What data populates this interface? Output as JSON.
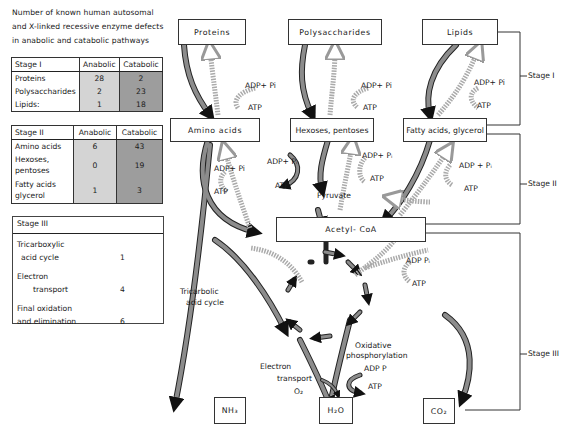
{
  "intro": {
    "lines": [
      "Number of known human autosomal",
      "and X-linked recessive enzyme defects",
      "in anabolic and catabolic pathways"
    ]
  },
  "table_stage1": {
    "title": "Stage I",
    "col_anabolic": "Anabolic",
    "col_catabolic": "Catabolic",
    "rows": [
      {
        "label": "Proteins",
        "anabolic": "28",
        "catabolic": "2"
      },
      {
        "label": "Polysaccharides",
        "anabolic": "2",
        "catabolic": "23"
      },
      {
        "label": "Lipids:",
        "anabolic": "1",
        "catabolic": "18"
      }
    ]
  },
  "table_stage2": {
    "title": "Stage II",
    "col_anabolic": "Anabolic",
    "col_catabolic": "Catabolic",
    "rows": [
      {
        "label": "Amino acids",
        "anabolic": "6",
        "catabolic": "43"
      },
      {
        "label": "Hexoses, pentoses",
        "anabolic": "0",
        "catabolic": "19"
      },
      {
        "label": "Fatty acids glycerol",
        "anabolic": "1",
        "catabolic": "3"
      }
    ]
  },
  "table_stage3": {
    "title": "Stage III",
    "rows": [
      {
        "label1": "Tricarboxylic",
        "label2": "acid cycle",
        "value": "1"
      },
      {
        "label1": "Electron",
        "label2": "transport",
        "value": "4"
      },
      {
        "label1": "Final oxidation",
        "label2": "and elimination",
        "value": "6"
      }
    ]
  },
  "diagram": {
    "stage1_sources": [
      "Proteins",
      "Polysaccharides",
      "Lipids"
    ],
    "stage2_products": [
      "Amino acids",
      "Hexoses, pentoses",
      "Fatty acids, glycerol"
    ],
    "intermediate": "Pyruvate",
    "hub": "Acetyl- CoA",
    "end_products": [
      "NH₃",
      "H₂O",
      "CO₂"
    ],
    "stage_labels": [
      "Stage I",
      "Stage II",
      "Stage III"
    ],
    "energy": {
      "adp_pi": "ADP+ Pi",
      "adp_pi_sub": "ADP+ Pᵢ",
      "adp_pi_spaced": "ADP + Pᵢ",
      "adp_p": "ADP Pᵢ",
      "adp_p2": "ADP P",
      "atp": "ATP"
    },
    "labels": {
      "tca_line1": "Tricarbolic",
      "tca_line2": "acid cycle",
      "oxphos_line1": "Oxidative",
      "oxphos_line2": "phosphorylation",
      "et_line1": "Electron",
      "et_line2": "transport",
      "o2": "O₂"
    },
    "colors": {
      "catabolic_arrow": "#8c8c8c",
      "anabolic_arrow": "#d9d9d9",
      "table_anabolic": "#d4d4d4",
      "table_catabolic": "#9d9d9d"
    }
  }
}
